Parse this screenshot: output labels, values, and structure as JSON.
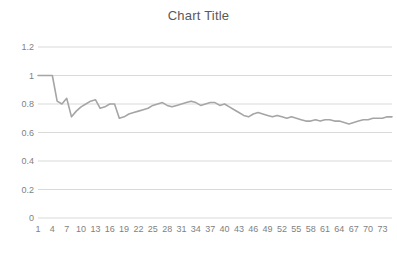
{
  "chart": {
    "title": "Chart Title",
    "colors": {
      "line": "#a5a5a5",
      "gridline": "#d9d9d9",
      "tick_label": "#7f7f7f",
      "title": "#595959",
      "background": "#ffffff"
    }
  },
  "chart_data": {
    "type": "line",
    "title": "Chart Title",
    "xlabel": "",
    "ylabel": "",
    "ylim": [
      0,
      1.2
    ],
    "xlim": [
      1,
      75
    ],
    "grid": true,
    "legend": "none",
    "y_ticks": [
      "0",
      "0.2",
      "0.4",
      "0.6",
      "0.8",
      "1",
      "1.2"
    ],
    "y_tick_values": [
      0,
      0.2,
      0.4,
      0.6,
      0.8,
      1,
      1.2
    ],
    "x_ticks": [
      "1",
      "4",
      "7",
      "10",
      "13",
      "16",
      "19",
      "22",
      "25",
      "28",
      "31",
      "34",
      "37",
      "40",
      "43",
      "46",
      "49",
      "52",
      "55",
      "58",
      "61",
      "64",
      "67",
      "70",
      "73"
    ],
    "x_tick_values": [
      1,
      4,
      7,
      10,
      13,
      16,
      19,
      22,
      25,
      28,
      31,
      34,
      37,
      40,
      43,
      46,
      49,
      52,
      55,
      58,
      61,
      64,
      67,
      70,
      73
    ],
    "x": [
      1,
      2,
      3,
      4,
      5,
      6,
      7,
      8,
      9,
      10,
      11,
      12,
      13,
      14,
      15,
      16,
      17,
      18,
      19,
      20,
      21,
      22,
      23,
      24,
      25,
      26,
      27,
      28,
      29,
      30,
      31,
      32,
      33,
      34,
      35,
      36,
      37,
      38,
      39,
      40,
      41,
      42,
      43,
      44,
      45,
      46,
      47,
      48,
      49,
      50,
      51,
      52,
      53,
      54,
      55,
      56,
      57,
      58,
      59,
      60,
      61,
      62,
      63,
      64,
      65,
      66,
      67,
      68,
      69,
      70,
      71,
      72,
      73,
      74,
      75
    ],
    "values": [
      1.0,
      1.0,
      1.0,
      1.0,
      0.82,
      0.8,
      0.84,
      0.71,
      0.75,
      0.78,
      0.8,
      0.82,
      0.83,
      0.77,
      0.78,
      0.8,
      0.8,
      0.7,
      0.71,
      0.73,
      0.74,
      0.75,
      0.76,
      0.77,
      0.79,
      0.8,
      0.81,
      0.79,
      0.78,
      0.79,
      0.8,
      0.81,
      0.82,
      0.81,
      0.79,
      0.8,
      0.81,
      0.81,
      0.79,
      0.8,
      0.78,
      0.76,
      0.74,
      0.72,
      0.71,
      0.73,
      0.74,
      0.73,
      0.72,
      0.71,
      0.72,
      0.71,
      0.7,
      0.71,
      0.7,
      0.69,
      0.68,
      0.68,
      0.69,
      0.68,
      0.69,
      0.69,
      0.68,
      0.68,
      0.67,
      0.66,
      0.67,
      0.68,
      0.69,
      0.69,
      0.7,
      0.7,
      0.7,
      0.71,
      0.71
    ],
    "series": [
      {
        "name": "Series 1",
        "values": [
          1.0,
          1.0,
          1.0,
          1.0,
          0.82,
          0.8,
          0.84,
          0.71,
          0.75,
          0.78,
          0.8,
          0.82,
          0.83,
          0.77,
          0.78,
          0.8,
          0.8,
          0.7,
          0.71,
          0.73,
          0.74,
          0.75,
          0.76,
          0.77,
          0.79,
          0.8,
          0.81,
          0.79,
          0.78,
          0.79,
          0.8,
          0.81,
          0.82,
          0.81,
          0.79,
          0.8,
          0.81,
          0.81,
          0.79,
          0.8,
          0.78,
          0.76,
          0.74,
          0.72,
          0.71,
          0.73,
          0.74,
          0.73,
          0.72,
          0.71,
          0.72,
          0.71,
          0.7,
          0.71,
          0.7,
          0.69,
          0.68,
          0.68,
          0.69,
          0.68,
          0.69,
          0.69,
          0.68,
          0.68,
          0.67,
          0.66,
          0.67,
          0.68,
          0.69,
          0.69,
          0.7,
          0.7,
          0.7,
          0.71,
          0.71
        ]
      }
    ]
  }
}
